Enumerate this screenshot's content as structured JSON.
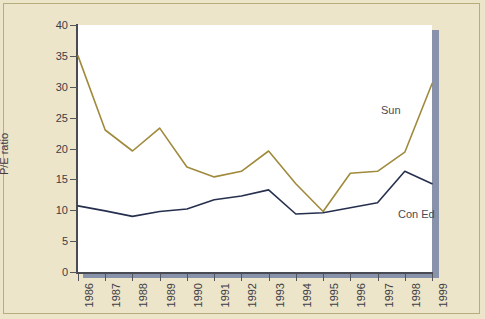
{
  "chart_data": {
    "type": "line",
    "title": "",
    "xlabel": "",
    "ylabel": "P/E ratio",
    "categories": [
      "1986",
      "1987",
      "1988",
      "1989",
      "1990",
      "1991",
      "1992",
      "1993",
      "1994",
      "1995",
      "1996",
      "1997",
      "1998",
      "1999"
    ],
    "ylim": [
      0,
      40
    ],
    "yticks": [
      0,
      5,
      10,
      15,
      20,
      25,
      30,
      35,
      40
    ],
    "grid": false,
    "legend_position": "inline-right",
    "series": [
      {
        "name": "Sun",
        "color": "#a08a3c",
        "values": [
          35.0,
          23.0,
          19.6,
          23.3,
          17.0,
          15.4,
          16.3,
          19.6,
          14.3,
          9.8,
          16.0,
          16.3,
          19.4,
          30.5
        ]
      },
      {
        "name": "Con Ed",
        "color": "#26304e",
        "values": [
          10.7,
          9.9,
          9.0,
          9.8,
          10.2,
          11.7,
          12.3,
          13.3,
          9.4,
          9.6,
          10.4,
          11.2,
          16.3,
          14.3
        ]
      }
    ]
  },
  "labels": {
    "y_axis_title": "P/E ratio",
    "series_sun": "Sun",
    "series_coned": "Con Ed"
  }
}
